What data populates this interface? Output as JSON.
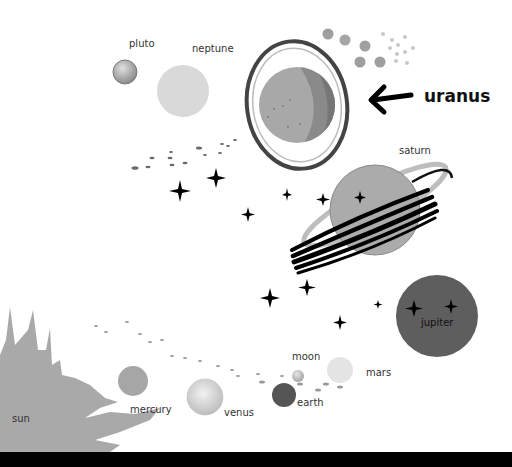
{
  "labels": {
    "pluto": "pluto",
    "neptune": "neptune",
    "uranus": "uranus",
    "saturn": "saturn",
    "jupiter": "jupiter",
    "mars": "mars",
    "moon": "moon",
    "earth": "earth",
    "venus": "venus",
    "mercury": "mercury",
    "sun": "sun"
  },
  "highlighted_planet": "uranus",
  "colors": {
    "background": "#ffffff",
    "sun": "#a9a9a9",
    "mercury": "#a6a6a6",
    "venus": "#d8d8d8",
    "earth": "#555555",
    "moon": "#c8c8c8",
    "mars": "#e4e4e4",
    "jupiter": "#5e5e5e",
    "saturn": "#ababab",
    "uranus_light": "#a8a8a8",
    "uranus_dark": "#808080",
    "neptune": "#d9d9d9",
    "pluto": "#a0a0a0",
    "star": "#000000",
    "bar": "#000000"
  }
}
